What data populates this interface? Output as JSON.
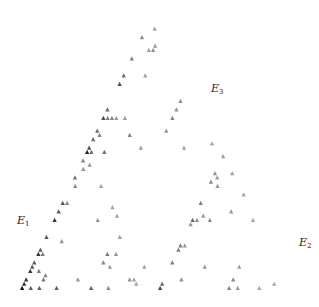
{
  "figure": {
    "ink_color": "#111111",
    "background": "#ffffff",
    "triangle": {
      "apex": [
        150,
        18
      ],
      "base_left": [
        20,
        290
      ],
      "base_right": [
        296,
        290
      ]
    },
    "recursion_depth": 6,
    "branch_weights": {
      "E1": 1.0,
      "E2": 0.42,
      "E3": 0.68
    },
    "labels": [
      {
        "id": "E1",
        "letter": "E",
        "sub": "1",
        "x": 17,
        "y": 215
      },
      {
        "id": "E2",
        "letter": "E",
        "sub": "2",
        "x": 299,
        "y": 237
      },
      {
        "id": "E3",
        "letter": "E",
        "sub": "3",
        "x": 211,
        "y": 83
      }
    ]
  }
}
